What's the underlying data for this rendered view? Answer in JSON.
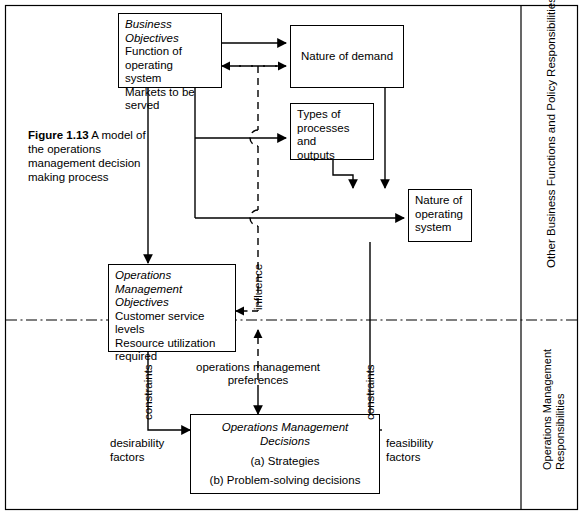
{
  "figure": {
    "number": "Figure 1.13",
    "caption": " A model of the operations management decision making process"
  },
  "boxes": {
    "business_objectives": {
      "title": "Business Objectives",
      "line1": "Function of operating",
      "line2": "system",
      "line3": "Markets to be served"
    },
    "nature_of_demand": {
      "label": "Nature of demand"
    },
    "types_of_processes": {
      "line1": "Types of",
      "line2": "processes and",
      "line3": "outputs"
    },
    "nature_of_operating_system": {
      "line1": "Nature of",
      "line2": "operating",
      "line3": "system"
    },
    "om_objectives": {
      "title1": "Operations",
      "title2": "Management",
      "title3": "Objectives",
      "line1": "Customer service levels",
      "line2": "Resource utilization",
      "line3": "required"
    },
    "om_decisions": {
      "title1": "Operations Management",
      "title2": "Decisions",
      "item_a": "(a) Strategies",
      "item_b": "(b) Problem-solving decisions"
    }
  },
  "edge_labels": {
    "influence": "influence",
    "constraints_left": "constraints",
    "constraints_right": "constraints",
    "desirability_factors_l1": "desirability",
    "desirability_factors_l2": "factors",
    "feasibility_factors_l1": "feasibility",
    "feasibility_factors_l2": "factors",
    "om_preferences_l1": "operations management",
    "om_preferences_l2": "preferences"
  },
  "zones": {
    "upper_right": "Other Business Functions and Policy Responsibilities",
    "lower_right_l1": "Operations Management",
    "lower_right_l2": "Responsibilities"
  },
  "colors": {
    "stroke": "#000000",
    "background": "#ffffff"
  }
}
